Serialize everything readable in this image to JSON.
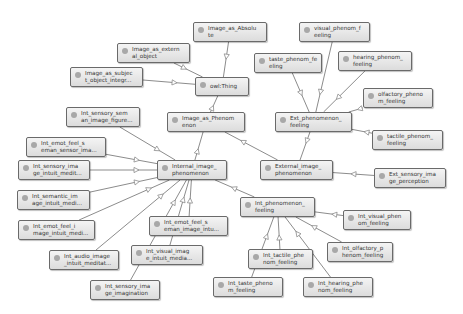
{
  "diagram": {
    "type": "ontology-class-graph",
    "nodes": [
      {
        "id": "owl_thing",
        "line1": "owl:Thing",
        "line2": "",
        "x": 195,
        "y": 77,
        "w": 54,
        "h": 19
      },
      {
        "id": "image_as_absolute",
        "line1": "Image_as_Absolu",
        "line2": "te",
        "x": 193,
        "y": 22,
        "w": 74,
        "h": 20
      },
      {
        "id": "image_as_external_object",
        "line1": "Image_as_extern",
        "line2": "al_object",
        "x": 117,
        "y": 43,
        "w": 73,
        "h": 20
      },
      {
        "id": "image_as_subject_object",
        "line1": "Image_as_subjec",
        "line2": "t_object_integr...",
        "x": 70,
        "y": 67,
        "w": 73,
        "h": 20
      },
      {
        "id": "image_as_phenomenon",
        "line1": "Image_as_Phenom",
        "line2": "enon",
        "x": 167,
        "y": 112,
        "w": 78,
        "h": 20
      },
      {
        "id": "int_sensory_semantic_image_figure",
        "line1": "Int_sensory_sem",
        "line2": "an_image_figure...",
        "x": 66,
        "y": 107,
        "w": 74,
        "h": 20
      },
      {
        "id": "int_emot_feel_semantic_sensor",
        "line1": "Int_emot_feel_s",
        "line2": "eman_sensor_ima...",
        "x": 26,
        "y": 137,
        "w": 80,
        "h": 20
      },
      {
        "id": "int_sensory_image_intuit_medit",
        "line1": "Int_sensory_ima",
        "line2": "ge_intuit_medit...",
        "x": 18,
        "y": 160,
        "w": 72,
        "h": 20
      },
      {
        "id": "int_semantic_image_intuit_medi",
        "line1": "Int_semantic_im",
        "line2": "age_intuit_medi...",
        "x": 17,
        "y": 190,
        "w": 73,
        "h": 20
      },
      {
        "id": "int_emot_feel_image_intuit_medi",
        "line1": "Int_emot_feel_i",
        "line2": "mage_intuit_medi...",
        "x": 18,
        "y": 220,
        "w": 77,
        "h": 20
      },
      {
        "id": "internal_image_phenomenon",
        "line1": "Internal_image_",
        "line2": "phenomenon",
        "x": 157,
        "y": 160,
        "w": 70,
        "h": 20
      },
      {
        "id": "external_image_phenomenon",
        "line1": "External_image_",
        "line2": "phenomenon",
        "x": 260,
        "y": 160,
        "w": 73,
        "h": 20
      },
      {
        "id": "ext_phenomenon_feeling",
        "line1": "Ext_phenomenon_",
        "line2": "feeling",
        "x": 275,
        "y": 112,
        "w": 77,
        "h": 20
      },
      {
        "id": "visual_phenom_feeling",
        "line1": "visual_phenom_f",
        "line2": "eeling",
        "x": 299,
        "y": 22,
        "w": 71,
        "h": 20
      },
      {
        "id": "taste_phenom_feeling",
        "line1": "taste_phenom_fe",
        "line2": "eling",
        "x": 254,
        "y": 53,
        "w": 68,
        "h": 20
      },
      {
        "id": "hearing_phenom_feeling",
        "line1": "hearing_phenom_",
        "line2": "feeling",
        "x": 338,
        "y": 51,
        "w": 74,
        "h": 20
      },
      {
        "id": "olfactory_phenom_feeling",
        "line1": "olfactory_pheno",
        "line2": "m_feeling",
        "x": 363,
        "y": 88,
        "w": 70,
        "h": 20
      },
      {
        "id": "tactile_phenom_feeling",
        "line1": "tactile_phenom_",
        "line2": "feeling",
        "x": 372,
        "y": 130,
        "w": 71,
        "h": 20
      },
      {
        "id": "ext_sensory_image_perception",
        "line1": "Ext_sensory_ima",
        "line2": "ge_perception",
        "x": 374,
        "y": 168,
        "w": 72,
        "h": 20
      },
      {
        "id": "int_phenomenon_feeling",
        "line1": "Int_phenomenon_",
        "line2": "feeling",
        "x": 240,
        "y": 197,
        "w": 75,
        "h": 20
      },
      {
        "id": "int_visual_phenom_feeling",
        "line1": "Int_visual_phen",
        "line2": "om_feeling",
        "x": 343,
        "y": 210,
        "w": 68,
        "h": 20
      },
      {
        "id": "int_olfactory_phenom_feeling",
        "line1": "Int_olfactory_p",
        "line2": "henom_feeling",
        "x": 327,
        "y": 242,
        "w": 66,
        "h": 20
      },
      {
        "id": "int_tactile_phenom_feeling",
        "line1": "Int_tactile_phe",
        "line2": "nom_feeling",
        "x": 248,
        "y": 249,
        "w": 65,
        "h": 20
      },
      {
        "id": "int_taste_phenom_feeling",
        "line1": "Int_taste_pheno",
        "line2": "m_feeling",
        "x": 213,
        "y": 277,
        "w": 70,
        "h": 20
      },
      {
        "id": "int_hearing_phenom_feeling",
        "line1": "Int_hearing_phe",
        "line2": "nom_feeling",
        "x": 303,
        "y": 277,
        "w": 70,
        "h": 20
      },
      {
        "id": "int_emot_feel_semantic_image_intu",
        "line1": "Int_emot_feel_s",
        "line2": "eman_image_intu...",
        "x": 149,
        "y": 216,
        "w": 79,
        "h": 20
      },
      {
        "id": "int_visual_image_intuit_media",
        "line1": "Int_visual_imag",
        "line2": "e_intuit_media...",
        "x": 131,
        "y": 245,
        "w": 72,
        "h": 20
      },
      {
        "id": "int_audio_image_intuit_meditat",
        "line1": "Int_audio_image",
        "line2": "_intuit_meditat...",
        "x": 49,
        "y": 250,
        "w": 70,
        "h": 20
      },
      {
        "id": "int_sensory_image_imagination",
        "line1": "Int_sensory_ima",
        "line2": "ge_imagination",
        "x": 90,
        "y": 280,
        "w": 70,
        "h": 20
      }
    ],
    "edges": [
      [
        "image_as_absolute",
        "owl_thing"
      ],
      [
        "image_as_external_object",
        "owl_thing"
      ],
      [
        "image_as_subject_object",
        "owl_thing"
      ],
      [
        "image_as_phenomenon",
        "owl_thing"
      ],
      [
        "internal_image_phenomenon",
        "image_as_phenomenon"
      ],
      [
        "external_image_phenomenon",
        "image_as_phenomenon"
      ],
      [
        "ext_phenomenon_feeling",
        "external_image_phenomenon"
      ],
      [
        "ext_sensory_image_perception",
        "external_image_phenomenon"
      ],
      [
        "visual_phenom_feeling",
        "ext_phenomenon_feeling"
      ],
      [
        "taste_phenom_feeling",
        "ext_phenomenon_feeling"
      ],
      [
        "hearing_phenom_feeling",
        "ext_phenomenon_feeling"
      ],
      [
        "olfactory_phenom_feeling",
        "ext_phenomenon_feeling"
      ],
      [
        "tactile_phenom_feeling",
        "ext_phenomenon_feeling"
      ],
      [
        "int_sensory_semantic_image_figure",
        "internal_image_phenomenon"
      ],
      [
        "int_emot_feel_semantic_sensor",
        "internal_image_phenomenon"
      ],
      [
        "int_sensory_image_intuit_medit",
        "internal_image_phenomenon"
      ],
      [
        "int_semantic_image_intuit_medi",
        "internal_image_phenomenon"
      ],
      [
        "int_emot_feel_image_intuit_medi",
        "internal_image_phenomenon"
      ],
      [
        "int_audio_image_intuit_meditat",
        "internal_image_phenomenon"
      ],
      [
        "int_sensory_image_imagination",
        "internal_image_phenomenon"
      ],
      [
        "int_visual_image_intuit_media",
        "internal_image_phenomenon"
      ],
      [
        "int_emot_feel_semantic_image_intu",
        "internal_image_phenomenon"
      ],
      [
        "int_phenomenon_feeling",
        "internal_image_phenomenon"
      ],
      [
        "int_visual_phenom_feeling",
        "int_phenomenon_feeling"
      ],
      [
        "int_olfactory_phenom_feeling",
        "int_phenomenon_feeling"
      ],
      [
        "int_tactile_phenom_feeling",
        "int_phenomenon_feeling"
      ],
      [
        "int_taste_phenom_feeling",
        "int_phenomenon_feeling"
      ],
      [
        "int_hearing_phenom_feeling",
        "int_phenomenon_feeling"
      ]
    ],
    "colors": {
      "edge": "#8c8c8c",
      "node_border": "#6a6a6a",
      "node_fill_top": "#f4f4f4",
      "node_fill_bottom": "#dcdcdc",
      "dot": "#a8a8a8",
      "text": "#333333"
    }
  }
}
